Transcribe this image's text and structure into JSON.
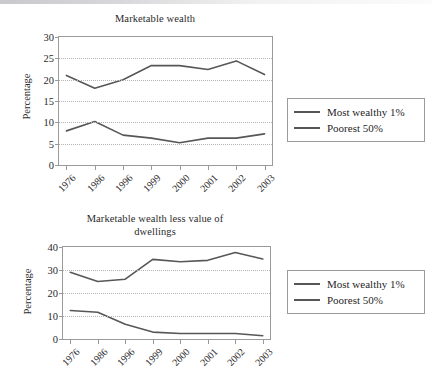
{
  "chart_data": [
    {
      "type": "line",
      "title": "Marketable wealth",
      "xlabel": "",
      "ylabel": "Percentage",
      "categories": [
        "1976",
        "1986",
        "1996",
        "1999",
        "2000",
        "2001",
        "2002",
        "2003"
      ],
      "ylim": [
        0,
        30
      ],
      "yticks": [
        0,
        5,
        10,
        15,
        20,
        25,
        30
      ],
      "grid": true,
      "legend_position": "right",
      "series": [
        {
          "name": "Most wealthy 1%",
          "values": [
            21,
            18,
            20,
            23.3,
            23.3,
            22.4,
            24.4,
            21.2
          ],
          "color": "#575757"
        },
        {
          "name": "Poorest 50%",
          "values": [
            8,
            10.2,
            7,
            6.3,
            5.2,
            6.3,
            6.3,
            7.3
          ],
          "color": "#575757"
        }
      ]
    },
    {
      "type": "line",
      "title": "Marketable wealth less value of dwellings",
      "xlabel": "",
      "ylabel": "Percentage",
      "categories": [
        "1976",
        "1986",
        "1996",
        "1999",
        "2000",
        "2001",
        "2002",
        "2003"
      ],
      "ylim": [
        0,
        40
      ],
      "yticks": [
        0,
        10,
        20,
        30,
        40
      ],
      "grid": true,
      "legend_position": "right",
      "series": [
        {
          "name": "Most wealthy 1%",
          "values": [
            29,
            25,
            26,
            34.6,
            33.6,
            34.2,
            37.6,
            34.8
          ],
          "color": "#575757"
        },
        {
          "name": "Poorest 50%",
          "values": [
            12.4,
            11.6,
            6.4,
            3,
            2.4,
            2.4,
            2.4,
            1.4
          ],
          "color": "#575757"
        }
      ]
    }
  ],
  "figures": [
    {
      "id": "marketable-wealth",
      "title": "Marketable wealth",
      "title_lines": [
        "Marketable wealth"
      ],
      "ylabel": "Percentage",
      "yticks": [
        "0",
        "5",
        "10",
        "15",
        "20",
        "25",
        "30"
      ],
      "xticks": [
        "1976",
        "1986",
        "1996",
        "1999",
        "2000",
        "2001",
        "2002",
        "2003"
      ],
      "legend": [
        {
          "label": "Most wealthy 1%"
        },
        {
          "label": "Poorest 50%"
        }
      ]
    },
    {
      "id": "marketable-wealth-less-dwellings",
      "title": "Marketable wealth less value of dwellings",
      "title_lines": [
        "Marketable wealth less value of",
        "dwellings"
      ],
      "ylabel": "Percentage",
      "yticks": [
        "0",
        "10",
        "20",
        "30",
        "40"
      ],
      "xticks": [
        "1976",
        "1986",
        "1996",
        "1999",
        "2000",
        "2001",
        "2002",
        "2003"
      ],
      "legend": [
        {
          "label": "Most wealthy 1%"
        },
        {
          "label": "Poorest 50%"
        }
      ]
    }
  ],
  "colors": {
    "line": "#575757",
    "axis": "#9a9a9a",
    "grid": "#b4b4b4",
    "text": "#2b2b2b",
    "background": "#ffffff"
  }
}
